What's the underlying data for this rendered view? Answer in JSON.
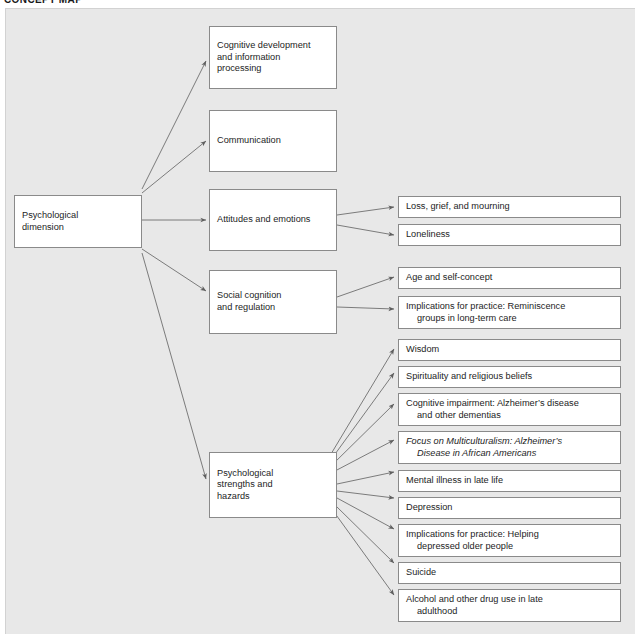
{
  "title": "CONCEPT MAP",
  "diagram": {
    "type": "concept-map",
    "root": {
      "id": "psychological-dimension",
      "label": "Psychological\ndimension"
    },
    "branches": [
      {
        "id": "cognitive-development",
        "label": "Cognitive development\nand information\nprocessing",
        "children": []
      },
      {
        "id": "communication",
        "label": "Communication",
        "children": []
      },
      {
        "id": "attitudes-and-emotions",
        "label": "Attitudes and emotions",
        "children": [
          {
            "id": "loss-grief-mourning",
            "line1": "Loss, grief, and mourning",
            "line2": "",
            "italic": false
          },
          {
            "id": "loneliness",
            "line1": "Loneliness",
            "line2": "",
            "italic": false
          }
        ]
      },
      {
        "id": "social-cognition",
        "label": "Social cognition\nand regulation",
        "children": [
          {
            "id": "age-and-self-concept",
            "line1": "Age and self-concept",
            "line2": "",
            "italic": false
          },
          {
            "id": "reminiscence-groups",
            "line1": "Implications for practice: Reminiscence",
            "line2": "groups in long-term care",
            "italic": false
          }
        ]
      },
      {
        "id": "psychological-strengths-hazards",
        "label": "Psychological\nstrengths and\nhazards",
        "children": [
          {
            "id": "wisdom",
            "line1": "Wisdom",
            "line2": "",
            "italic": false
          },
          {
            "id": "spirituality",
            "line1": "Spirituality and religious beliefs",
            "line2": "",
            "italic": false
          },
          {
            "id": "cognitive-impairment",
            "line1": "Cognitive impairment: Alzheimer’s disease",
            "line2": "and other dementias",
            "italic": false
          },
          {
            "id": "focus-multiculturalism",
            "line1": "Focus on Multiculturalism: Alzheimer’s",
            "line2": "Disease in African Americans",
            "italic": true
          },
          {
            "id": "mental-illness",
            "line1": "Mental illness in late life",
            "line2": "",
            "italic": false
          },
          {
            "id": "depression",
            "line1": "Depression",
            "line2": "",
            "italic": false
          },
          {
            "id": "helping-depressed-older-people",
            "line1": "Implications for practice: Helping",
            "line2": "depressed older people",
            "italic": false
          },
          {
            "id": "suicide",
            "line1": "Suicide",
            "line2": "",
            "italic": false
          },
          {
            "id": "alcohol-drug-use",
            "line1": "Alcohol and other drug use in late",
            "line2": "adulthood",
            "italic": false
          }
        ]
      }
    ],
    "colors": {
      "panel_background": "#e8e8e8",
      "node_fill": "#ffffff",
      "node_border": "#8a8a8a",
      "edge": "#6e6e6e",
      "text": "#1d1d1d"
    }
  }
}
